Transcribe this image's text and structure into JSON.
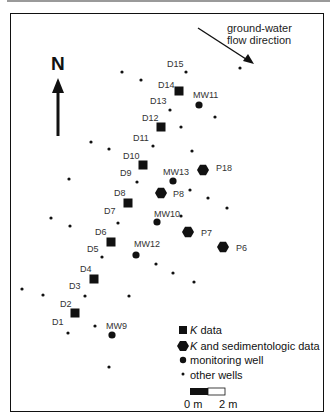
{
  "map": {
    "north_label": "N",
    "flow_label_line1": "ground-water",
    "flow_label_line2": "flow direction",
    "colors": {
      "marker": "#111111",
      "label": "#333333",
      "frame": "#111111"
    }
  },
  "wells": {
    "k_data": [
      {
        "id": "D14",
        "x": 179,
        "y": 91,
        "lx": 158,
        "ly": 88
      },
      {
        "id": "D12",
        "x": 161,
        "y": 127,
        "lx": 142,
        "ly": 121
      },
      {
        "id": "D10",
        "x": 143,
        "y": 165,
        "lx": 123,
        "ly": 159
      },
      {
        "id": "D8",
        "x": 128,
        "y": 203,
        "lx": 114,
        "ly": 196
      },
      {
        "id": "D6",
        "x": 111,
        "y": 242,
        "lx": 95,
        "ly": 235
      },
      {
        "id": "D4",
        "x": 94,
        "y": 279,
        "lx": 80,
        "ly": 272
      },
      {
        "id": "D2",
        "x": 75,
        "y": 313,
        "lx": 60,
        "ly": 307
      }
    ],
    "k_sed_data": [
      {
        "id": "P18",
        "x": 203,
        "y": 170,
        "lx": 216,
        "ly": 171
      },
      {
        "id": "P8",
        "x": 161,
        "y": 193,
        "lx": 173,
        "ly": 197
      },
      {
        "id": "P7",
        "x": 188,
        "y": 232,
        "lx": 201,
        "ly": 236
      },
      {
        "id": "P6",
        "x": 223,
        "y": 247,
        "lx": 236,
        "ly": 251
      }
    ],
    "monitoring": [
      {
        "id": "MW11",
        "x": 199,
        "y": 105,
        "lx": 193,
        "ly": 98
      },
      {
        "id": "MW13",
        "x": 173,
        "y": 181,
        "lx": 163,
        "ly": 175
      },
      {
        "id": "MW10",
        "x": 157,
        "y": 222,
        "lx": 154,
        "ly": 217
      },
      {
        "id": "MW12",
        "x": 136,
        "y": 255,
        "lx": 134,
        "ly": 247
      },
      {
        "id": "MW9",
        "x": 112,
        "y": 335,
        "lx": 106,
        "ly": 329
      }
    ],
    "labeled_other": [
      {
        "id": "D15",
        "x": 186,
        "y": 72,
        "lx": 167,
        "ly": 67
      },
      {
        "id": "D13",
        "x": 170,
        "y": 110,
        "lx": 150,
        "ly": 104
      },
      {
        "id": "D11",
        "x": 153,
        "y": 146,
        "lx": 133,
        "ly": 141
      },
      {
        "id": "D9",
        "x": 137,
        "y": 182,
        "lx": 120,
        "ly": 176
      },
      {
        "id": "D7",
        "x": 118,
        "y": 223,
        "lx": 104,
        "ly": 214
      },
      {
        "id": "D5",
        "x": 102,
        "y": 257,
        "lx": 87,
        "ly": 252
      },
      {
        "id": "D3",
        "x": 85,
        "y": 296,
        "lx": 69,
        "ly": 289
      },
      {
        "id": "D1",
        "x": 68,
        "y": 333,
        "lx": 52,
        "ly": 325
      }
    ],
    "other": [
      {
        "x": 122,
        "y": 72
      },
      {
        "x": 141,
        "y": 80
      },
      {
        "x": 240,
        "y": 68
      },
      {
        "x": 215,
        "y": 117
      },
      {
        "x": 181,
        "y": 127
      },
      {
        "x": 91,
        "y": 142
      },
      {
        "x": 109,
        "y": 149
      },
      {
        "x": 192,
        "y": 151
      },
      {
        "x": 69,
        "y": 179
      },
      {
        "x": 190,
        "y": 190
      },
      {
        "x": 208,
        "y": 198
      },
      {
        "x": 227,
        "y": 208
      },
      {
        "x": 181,
        "y": 216
      },
      {
        "x": 51,
        "y": 218
      },
      {
        "x": 70,
        "y": 226
      },
      {
        "x": 156,
        "y": 264
      },
      {
        "x": 173,
        "y": 273
      },
      {
        "x": 194,
        "y": 282
      },
      {
        "x": 22,
        "y": 289
      },
      {
        "x": 43,
        "y": 295
      },
      {
        "x": 129,
        "y": 296
      },
      {
        "x": 95,
        "y": 326
      },
      {
        "x": 109,
        "y": 367
      }
    ]
  },
  "legend": {
    "items": [
      {
        "symbol": "square",
        "italic": "K",
        "label": " data"
      },
      {
        "symbol": "hexagon",
        "italic": "K",
        "label": " and sedimentologic data"
      },
      {
        "symbol": "circle",
        "italic": "",
        "label": "monitoring well"
      },
      {
        "symbol": "dot",
        "italic": "",
        "label": "other wells"
      }
    ],
    "scale": {
      "left_label": "0 m",
      "right_label": "2 m"
    }
  }
}
